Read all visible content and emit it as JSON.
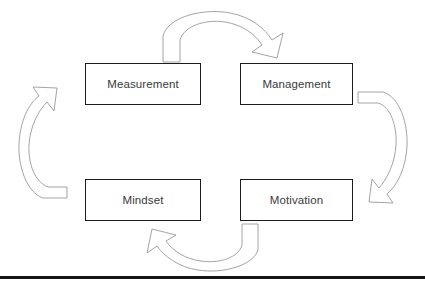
{
  "diagram": {
    "type": "cycle",
    "direction": "clockwise",
    "background_color": "#ffffff",
    "box_border_color": "#1c1c1c",
    "arrow_stroke_color": "#9a9a9a",
    "text_color": "#3a3a3a",
    "rule_color": "#141414",
    "nodes": [
      {
        "id": "measurement",
        "label": "Measurement",
        "position": "top-left"
      },
      {
        "id": "management",
        "label": "Management",
        "position": "top-right"
      },
      {
        "id": "motivation",
        "label": "Motivation",
        "position": "bottom-right"
      },
      {
        "id": "mindset",
        "label": "Mindset",
        "position": "bottom-left"
      }
    ],
    "arrows": [
      {
        "id": "top",
        "from": "measurement",
        "to": "management",
        "name": "arrow-measurement-to-management"
      },
      {
        "id": "right",
        "from": "management",
        "to": "motivation",
        "name": "arrow-management-to-motivation"
      },
      {
        "id": "bottom",
        "from": "motivation",
        "to": "mindset",
        "name": "arrow-motivation-to-mindset"
      },
      {
        "id": "left",
        "from": "mindset",
        "to": "measurement",
        "name": "arrow-mindset-to-measurement"
      }
    ]
  }
}
